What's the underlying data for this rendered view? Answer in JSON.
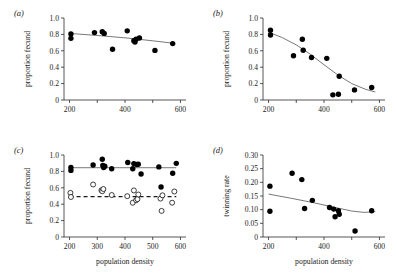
{
  "figure": {
    "panels": [
      "a",
      "b",
      "c",
      "d"
    ]
  },
  "labels": {
    "panel_a": "(a)",
    "panel_b": "(b)",
    "panel_c": "(c)",
    "panel_d": "(d)",
    "proportion_fecund": "proportion fecund",
    "twinning_rate": "twinning rate",
    "population_density": "population density"
  },
  "chart_data": [
    {
      "id": "a",
      "type": "scatter",
      "title": "(a)",
      "xlabel": "",
      "ylabel": "proportion fecund",
      "xlim": [
        180,
        620
      ],
      "ylim": [
        0,
        1.0
      ],
      "xticks": [
        200,
        300,
        400,
        500,
        600
      ],
      "xticklabels": [
        "200",
        "",
        "400",
        "",
        "600"
      ],
      "yticks": [
        0,
        0.2,
        0.4,
        0.6,
        0.8,
        1.0
      ],
      "yticklabels": [
        "0",
        "0.2",
        "0.4",
        "0.6",
        "0.8",
        "1.0"
      ],
      "grid": false,
      "legend": "none",
      "series": [
        {
          "name": "proportion fecund",
          "marker": "filled-circle",
          "points": [
            [
              205,
              0.805
            ],
            [
              205,
              0.752
            ],
            [
              290,
              0.822
            ],
            [
              318,
              0.832
            ],
            [
              325,
              0.812
            ],
            [
              355,
              0.618
            ],
            [
              408,
              0.843
            ],
            [
              432,
              0.722
            ],
            [
              436,
              0.706
            ],
            [
              440,
              0.742
            ],
            [
              452,
              0.757
            ],
            [
              508,
              0.605
            ],
            [
              572,
              0.688
            ]
          ]
        }
      ],
      "fit_line": {
        "style": "solid",
        "points": [
          [
            200,
            0.812
          ],
          [
            300,
            0.787
          ],
          [
            400,
            0.758
          ],
          [
            500,
            0.722
          ],
          [
            580,
            0.69
          ]
        ]
      }
    },
    {
      "id": "b",
      "type": "scatter",
      "title": "(b)",
      "xlabel": "",
      "ylabel": "proportion fecund",
      "xlim": [
        180,
        620
      ],
      "ylim": [
        0,
        1.0
      ],
      "xticks": [
        200,
        300,
        400,
        500,
        600
      ],
      "xticklabels": [
        "200",
        "",
        "400",
        "",
        "600"
      ],
      "yticks": [
        0,
        0.2,
        0.4,
        0.6,
        0.8,
        1.0
      ],
      "yticklabels": [
        "0",
        "0.2",
        "0.4",
        "0.6",
        "0.8",
        "1.0"
      ],
      "grid": false,
      "legend": "none",
      "series": [
        {
          "name": "proportion fecund",
          "marker": "filled-circle",
          "points": [
            [
              207,
              0.852
            ],
            [
              207,
              0.793
            ],
            [
              290,
              0.54
            ],
            [
              322,
              0.74
            ],
            [
              325,
              0.607
            ],
            [
              355,
              0.518
            ],
            [
              410,
              0.508
            ],
            [
              432,
              0.063
            ],
            [
              452,
              0.07
            ],
            [
              455,
              0.29
            ],
            [
              510,
              0.123
            ],
            [
              572,
              0.152
            ]
          ]
        }
      ],
      "fit_line": {
        "style": "solid",
        "points": [
          [
            200,
            0.828
          ],
          [
            250,
            0.76
          ],
          [
            300,
            0.672
          ],
          [
            350,
            0.56
          ],
          [
            400,
            0.43
          ],
          [
            450,
            0.305
          ],
          [
            500,
            0.2
          ],
          [
            550,
            0.13
          ],
          [
            585,
            0.098
          ]
        ]
      }
    },
    {
      "id": "c",
      "type": "scatter",
      "title": "(c)",
      "xlabel": "population density",
      "ylabel": "proportion fecund",
      "xlim": [
        180,
        620
      ],
      "ylim": [
        0,
        1.0
      ],
      "xticks": [
        200,
        300,
        400,
        500,
        600
      ],
      "xticklabels": [
        "200",
        "300",
        "400",
        "500",
        "600"
      ],
      "yticks": [
        0,
        0.2,
        0.4,
        0.6,
        0.8,
        1.0
      ],
      "yticklabels": [
        "0",
        "0.2",
        "0.4",
        "0.6",
        "0.8",
        "1.0"
      ],
      "grid": false,
      "legend": "none",
      "series": [
        {
          "name": "adults",
          "marker": "filled-circle",
          "points": [
            [
              205,
              0.848
            ],
            [
              205,
              0.812
            ],
            [
              285,
              0.878
            ],
            [
              318,
              0.948
            ],
            [
              320,
              0.872
            ],
            [
              323,
              0.848
            ],
            [
              327,
              0.862
            ],
            [
              352,
              0.832
            ],
            [
              410,
              0.908
            ],
            [
              428,
              0.832
            ],
            [
              432,
              0.895
            ],
            [
              442,
              0.885
            ],
            [
              448,
              0.888
            ],
            [
              458,
              0.768
            ],
            [
              522,
              0.855
            ],
            [
              530,
              0.61
            ],
            [
              572,
              0.778
            ],
            [
              585,
              0.898
            ]
          ]
        },
        {
          "name": "yearlings",
          "marker": "open-circle",
          "points": [
            [
              203,
              0.538
            ],
            [
              205,
              0.488
            ],
            [
              285,
              0.64
            ],
            [
              315,
              0.57
            ],
            [
              318,
              0.558
            ],
            [
              322,
              0.585
            ],
            [
              352,
              0.512
            ],
            [
              408,
              0.498
            ],
            [
              428,
              0.418
            ],
            [
              432,
              0.568
            ],
            [
              440,
              0.448
            ],
            [
              445,
              0.462
            ],
            [
              448,
              0.518
            ],
            [
              528,
              0.468
            ],
            [
              532,
              0.318
            ],
            [
              535,
              0.508
            ],
            [
              570,
              0.418
            ],
            [
              578,
              0.555
            ]
          ]
        }
      ],
      "fit_lines": [
        {
          "style": "solid",
          "points": [
            [
              200,
              0.845
            ],
            [
              585,
              0.845
            ]
          ]
        },
        {
          "style": "dashed",
          "points": [
            [
              200,
              0.492
            ],
            [
              585,
              0.492
            ]
          ]
        }
      ]
    },
    {
      "id": "d",
      "type": "scatter",
      "title": "(d)",
      "xlabel": "population density",
      "ylabel": "twinning rate",
      "xlim": [
        180,
        620
      ],
      "ylim": [
        0,
        0.3
      ],
      "xticks": [
        200,
        300,
        400,
        500,
        600
      ],
      "xticklabels": [
        "200",
        "",
        "400",
        "",
        "600"
      ],
      "yticks": [
        0,
        0.05,
        0.1,
        0.15,
        0.2,
        0.25,
        0.3
      ],
      "yticklabels": [
        "0",
        "0.05",
        "0.10",
        "0.15",
        "0.20",
        "0.25",
        "0.30"
      ],
      "grid": false,
      "legend": "none",
      "series": [
        {
          "name": "twinning rate",
          "marker": "filled-circle",
          "points": [
            [
              205,
              0.186
            ],
            [
              205,
              0.094
            ],
            [
              285,
              0.233
            ],
            [
              320,
              0.21
            ],
            [
              330,
              0.104
            ],
            [
              358,
              0.134
            ],
            [
              420,
              0.108
            ],
            [
              435,
              0.102
            ],
            [
              440,
              0.074
            ],
            [
              452,
              0.096
            ],
            [
              455,
              0.083
            ],
            [
              512,
              0.022
            ],
            [
              572,
              0.096
            ]
          ]
        }
      ],
      "fit_line": {
        "style": "solid",
        "points": [
          [
            200,
            0.157
          ],
          [
            280,
            0.142
          ],
          [
            360,
            0.126
          ],
          [
            440,
            0.108
          ],
          [
            500,
            0.095
          ],
          [
            545,
            0.09
          ],
          [
            585,
            0.093
          ]
        ]
      }
    }
  ]
}
